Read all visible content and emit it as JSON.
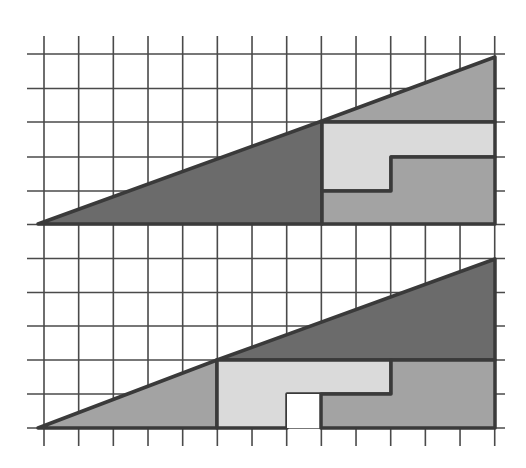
{
  "caption": "Two 13×5 triangles built from the same four pieces; the lower arrangement shows a one-square gap",
  "colors": {
    "background": "#ffffff",
    "grid": "#4a4a4a",
    "outline": "#3a3a3a",
    "dark": "#6b6b6b",
    "medium": "#a3a3a3",
    "light": "#dadada",
    "hole": "#ffffff"
  },
  "grid": {
    "columns": 13,
    "rows": 11,
    "unit_px": 34.67,
    "origin_x": 44,
    "origin_y": 54
  },
  "figures": [
    {
      "name": "top-triangle",
      "width_units": 13,
      "height_units": 5,
      "pieces": [
        {
          "name": "dark-triangle",
          "shade": "dark",
          "size": "8x3"
        },
        {
          "name": "medium-triangle",
          "shade": "medium",
          "size": "5x2"
        },
        {
          "name": "light-l-shape",
          "shade": "light",
          "cells": 7
        },
        {
          "name": "medium-l-shape",
          "shade": "medium",
          "cells": 8
        }
      ]
    },
    {
      "name": "bottom-triangle",
      "width_units": 13,
      "height_units": 5,
      "pieces": [
        {
          "name": "medium-triangle",
          "shade": "medium",
          "size": "5x2"
        },
        {
          "name": "dark-triangle",
          "shade": "dark",
          "size": "8x3"
        },
        {
          "name": "light-l-shape",
          "shade": "light",
          "cells": 7
        },
        {
          "name": "medium-l-shape",
          "shade": "medium",
          "cells": 8
        },
        {
          "name": "missing-square",
          "shade": "hole",
          "cells": 1
        }
      ]
    }
  ]
}
